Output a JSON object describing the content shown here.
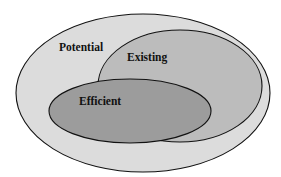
{
  "diagram": {
    "type": "nested-ellipse-venn",
    "sets": [
      {
        "id": "potential",
        "label": "Potential",
        "fill": "#dcdcdc"
      },
      {
        "id": "existing",
        "label": "Existing",
        "fill": "#bcbcbc"
      },
      {
        "id": "efficient",
        "label": "Efficient",
        "fill": "#9c9c9c"
      }
    ],
    "stroke": "#111111"
  }
}
